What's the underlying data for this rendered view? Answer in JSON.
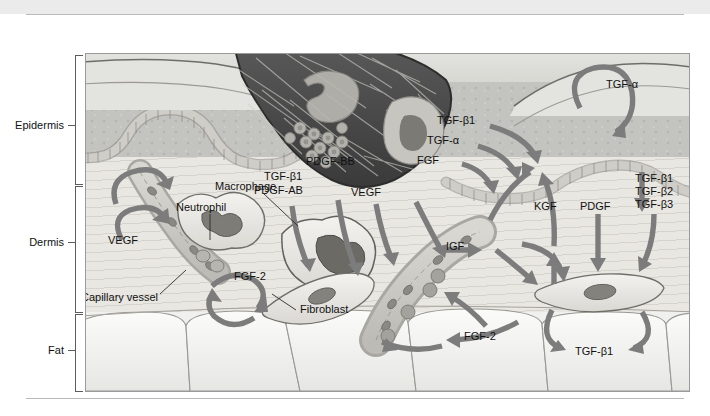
{
  "figure": {
    "title_visible": false,
    "layers": [
      {
        "name": "Epidermis",
        "label": "Epidermis"
      },
      {
        "name": "Dermis",
        "label": "Dermis"
      },
      {
        "name": "Fat",
        "label": "Fat"
      }
    ],
    "structures": [
      {
        "name": "fibrin-clot",
        "label": "Fibrin clot"
      },
      {
        "name": "macrophage",
        "label": "Macrophage"
      },
      {
        "name": "neutrophil",
        "label": "Neutrophil"
      },
      {
        "name": "capillary-vessel",
        "label": "Capillary vessel"
      },
      {
        "name": "fibroblast",
        "label": "Fibroblast"
      }
    ],
    "growth_factors": {
      "clot_left": [
        "TGF-β1",
        "PDGF-AB"
      ],
      "clot_mid_top": "PDGF-BB",
      "clot_mid_bottom": "VEGF",
      "clot_right": [
        "TGF-β1",
        "TGF-α",
        "FGF"
      ],
      "epidermis_right_loop": "TGF-α",
      "dermis_left_loop": "VEGF",
      "dermis_left_fgf": "FGF-2",
      "wound_bed_igf": "IGF",
      "wound_bed_fgf": "FGF-2",
      "fibroblast_kgf": "KGF",
      "fibroblast_pdgf": "PDGF",
      "fibroblast_tgfb_stack": [
        "TGF-β1",
        "TGF-β2",
        "TGF-β3"
      ],
      "fibroblast_loop": "TGF-β1"
    },
    "colors": {
      "arrow": "#7c7c7c",
      "clot_dark": "#4a4a4a",
      "epidermis": "#c3c3bf",
      "dermis": "#e9e7e2",
      "fat": "#f0f0ee",
      "band": "#ebebeb",
      "rule": "#b9b9b9",
      "text": "#111111"
    }
  }
}
